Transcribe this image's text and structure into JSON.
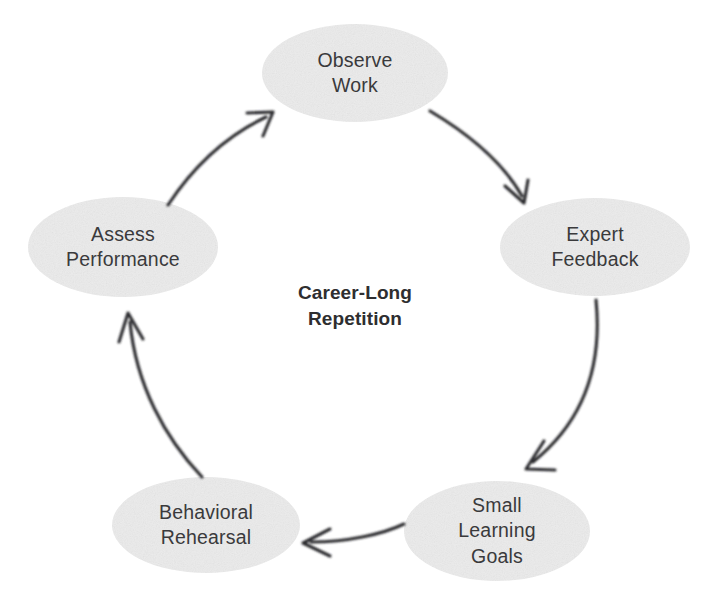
{
  "diagram": {
    "type": "cycle",
    "title": "Career-Long Repetition",
    "center_caption": "Career-Long\nRepetition",
    "background_color": "#ffffff",
    "node_fill_color": "#ececec",
    "node_text_color": "#3a3a3c",
    "arrow_color": "#2b2b2d",
    "direction": "clockwise",
    "nodes": [
      {
        "id": "observe-work",
        "label": "Observe\nWork",
        "line1": "Observe",
        "line2": "Work",
        "cx": 355,
        "cy": 73,
        "rx": 93,
        "ry": 49
      },
      {
        "id": "expert-feedback",
        "label": "Expert\nFeedback",
        "line1": "Expert",
        "line2": "Feedback",
        "cx": 595,
        "cy": 247,
        "rx": 95,
        "ry": 49
      },
      {
        "id": "small-learning-goals",
        "label": "Small\nLearning\nGoals",
        "line1": "Small",
        "line2": "Learning",
        "line3": "Goals",
        "cx": 497,
        "cy": 531,
        "rx": 93,
        "ry": 50
      },
      {
        "id": "behavioral-rehearsal",
        "label": "Behavioral\nRehearsal",
        "line1": "Behavioral",
        "line2": "Rehearsal",
        "cx": 206,
        "cy": 525,
        "rx": 94,
        "ry": 48
      },
      {
        "id": "assess-performance",
        "label": "Assess\nPerformance",
        "line1": "Assess",
        "line2": "Performance",
        "cx": 123,
        "cy": 247,
        "rx": 95,
        "ry": 50
      }
    ],
    "edges": [
      {
        "id": "edge-observe-to-expert",
        "from": "observe-work",
        "to": "expert-feedback"
      },
      {
        "id": "edge-expert-to-goals",
        "from": "expert-feedback",
        "to": "small-learning-goals"
      },
      {
        "id": "edge-goals-to-rehearsal",
        "from": "small-learning-goals",
        "to": "behavioral-rehearsal"
      },
      {
        "id": "edge-rehearsal-to-assess",
        "from": "behavioral-rehearsal",
        "to": "assess-performance"
      },
      {
        "id": "edge-assess-to-observe",
        "from": "assess-performance",
        "to": "observe-work"
      }
    ]
  }
}
